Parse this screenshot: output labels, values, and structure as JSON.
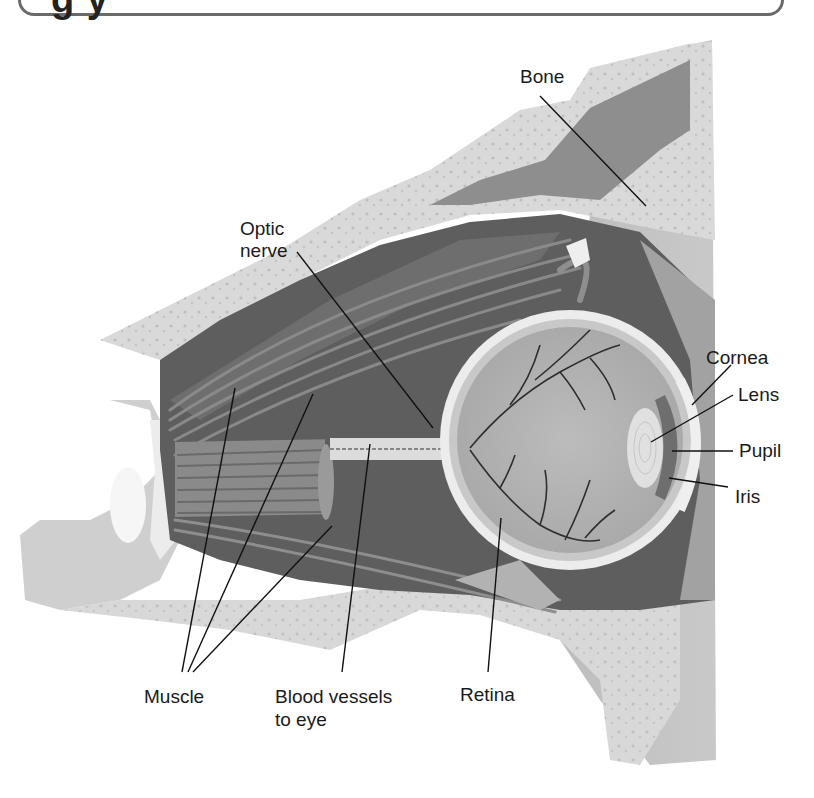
{
  "figure": {
    "heading_partial": "g                                                                          y",
    "labels": {
      "bone": "Bone",
      "optic_nerve_line1": "Optic",
      "optic_nerve_line2": "nerve",
      "cornea": "Cornea",
      "lens": "Lens",
      "pupil": "Pupil",
      "iris": "Iris",
      "muscle": "Muscle",
      "blood_vessels_line1": "Blood vessels",
      "blood_vessels_line2": "to eye",
      "retina": "Retina"
    }
  },
  "colors": {
    "background": "#ffffff",
    "bone": "#d9d9d9",
    "bone_speckle": "#a8a8a8",
    "tissue_dark": "#5e5e5e",
    "tissue_mid": "#8a8a8a",
    "eye_interior": "#b4b4b4",
    "sclera": "#eeeeee",
    "vessels": "#2e2e2e",
    "leader_line": "#111111"
  }
}
